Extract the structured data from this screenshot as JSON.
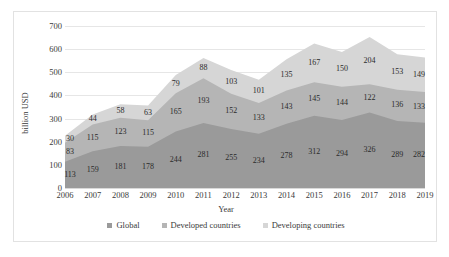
{
  "chart_data": {
    "type": "area",
    "stacked": true,
    "title": "",
    "xlabel": "Year",
    "ylabel": "billion USD",
    "categories": [
      "2006",
      "2007",
      "2008",
      "2009",
      "2010",
      "2011",
      "2012",
      "2013",
      "2014",
      "2015",
      "2016",
      "2017",
      "2018",
      "2019"
    ],
    "ylim": [
      0,
      700
    ],
    "yticks": [
      0,
      100,
      200,
      300,
      400,
      500,
      600,
      700
    ],
    "grid": true,
    "legend_position": "bottom",
    "series": [
      {
        "name": "Global",
        "color": "#9a9a9a",
        "values": [
          113,
          159,
          181,
          178,
          244,
          281,
          255,
          234,
          278,
          312,
          294,
          326,
          289,
          282
        ]
      },
      {
        "name": "Developed countries",
        "color": "#b5b5b5",
        "values": [
          83,
          115,
          123,
          115,
          165,
          193,
          152,
          133,
          143,
          145,
          144,
          122,
          136,
          133
        ]
      },
      {
        "name": "Developing countries",
        "color": "#d6d6d6",
        "values": [
          30,
          44,
          58,
          63,
          79,
          88,
          103,
          101,
          135,
          167,
          150,
          204,
          153,
          149
        ]
      }
    ]
  },
  "axis": {
    "y_title": "billion USD",
    "x_title": "Year"
  },
  "legend": {
    "items": [
      {
        "label": "Global",
        "color": "#9a9a9a"
      },
      {
        "label": "Developed countries",
        "color": "#b5b5b5"
      },
      {
        "label": "Developing countries",
        "color": "#d6d6d6"
      }
    ]
  }
}
